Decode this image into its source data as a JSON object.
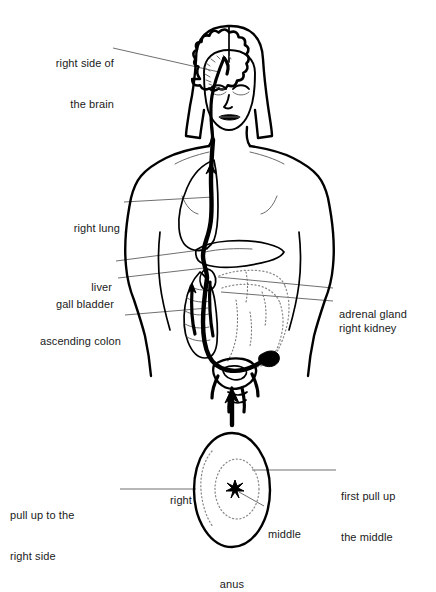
{
  "figure": {
    "type": "anatomical-line-diagram",
    "background_color": "#ffffff",
    "line_color": "#000000",
    "label_color": "#1a1a1a",
    "leader_line_color": "#555555"
  },
  "body_diagram": {
    "name": "female-figure-front-view",
    "labels_left": [
      {
        "id": "right-side-of-the-brain",
        "line1": "right side of",
        "line2": "the brain"
      },
      {
        "id": "right-lung",
        "line1": "right lung",
        "line2": ""
      },
      {
        "id": "liver",
        "line1": "liver",
        "line2": ""
      },
      {
        "id": "gall-bladder",
        "line1": "gall bladder",
        "line2": ""
      },
      {
        "id": "ascending-colon",
        "line1": "ascending colon",
        "line2": ""
      }
    ],
    "labels_right": [
      {
        "id": "adrenal-gland",
        "line1": "adrenal gland",
        "line2": ""
      },
      {
        "id": "right-kidney",
        "line1": "right kidney",
        "line2": ""
      }
    ]
  },
  "anus_diagram": {
    "name": "anus-detail-view",
    "caption": "anus",
    "inner_labels": [
      {
        "id": "right",
        "text": "right"
      },
      {
        "id": "middle",
        "text": "middle"
      }
    ],
    "labels_left": [
      {
        "id": "pull-up-to-the-right-side",
        "line1": "pull up to the",
        "line2": "right side"
      }
    ],
    "labels_right": [
      {
        "id": "first-pull-up-the-middle",
        "line1": "first pull up",
        "line2": "the middle"
      }
    ],
    "direction_arrow": "up"
  }
}
